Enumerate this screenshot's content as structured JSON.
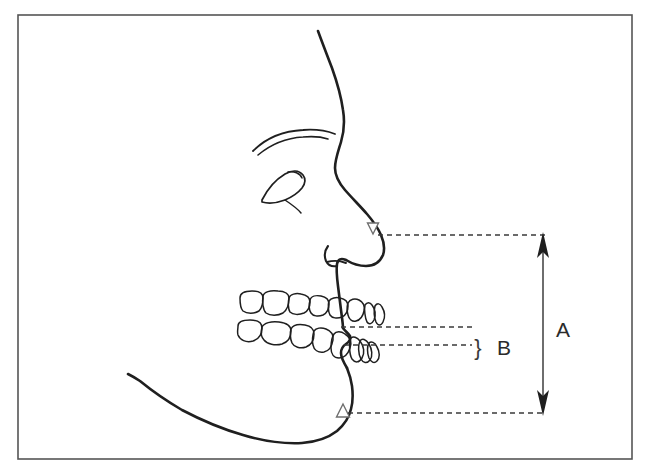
{
  "figure": {
    "type": "line-drawing-diagram",
    "background_color": "#ffffff",
    "border": {
      "present": true,
      "color": "#555555",
      "x": 18,
      "y": 15,
      "width": 614,
      "height": 444,
      "stroke_width": 1.6
    },
    "ink_color": "#1f1f1f",
    "marker_color": "#6f6f6f",
    "dash_color": "#3a3a3a"
  },
  "labels": [
    {
      "id": "measure-a",
      "text": "A",
      "x": 556,
      "y": 330,
      "meaning": "total vertical distance between upper reference marker and lower reference marker"
    },
    {
      "id": "measure-b",
      "text": "B",
      "x": 497,
      "y": 348,
      "meaning": "vertical distance between the two occlusal reference lines"
    },
    {
      "id": "brace-b",
      "text": "}",
      "x": 478,
      "y": 348,
      "meaning": "brace grouping the two occlusal dashed lines"
    }
  ],
  "markers": [
    {
      "id": "upper-marker",
      "glyph": "down-triangle",
      "x": 373,
      "y": 228,
      "size": 11,
      "filled": false,
      "description": "hollow downward-pointing triangle at the subnasale level on the nose underside"
    },
    {
      "id": "lower-marker",
      "glyph": "up-triangle",
      "x": 343,
      "y": 413,
      "size": 11,
      "filled": false,
      "description": "hollow upward-pointing triangle at the menton / chin level"
    }
  ],
  "dashed_lines": [
    {
      "id": "top-reference-line",
      "x1": 378,
      "y1": 235,
      "x2": 546,
      "y2": 235
    },
    {
      "id": "upper-occlusal-line",
      "x1": 341,
      "y1": 327,
      "x2": 472,
      "y2": 327
    },
    {
      "id": "lower-occlusal-line",
      "x1": 344,
      "y1": 345,
      "x2": 472,
      "y2": 345
    },
    {
      "id": "bottom-reference-line",
      "x1": 348,
      "y1": 413,
      "x2": 546,
      "y2": 413
    }
  ],
  "arrows": [
    {
      "id": "a-double-arrow",
      "orientation": "vertical",
      "double_headed": true,
      "x": 543,
      "y_top": 237,
      "y_bottom": 411,
      "connects": [
        "top-reference-line",
        "bottom-reference-line"
      ],
      "label": "A"
    }
  ],
  "anatomy": {
    "profile_outline": "forehead, glabella, nasal bridge, nose tip, columella, upper lip, lips, lower lip, mental sulcus, chin, jawline",
    "features": [
      "eyebrow",
      "eye",
      "nostril",
      "nasolabial hint",
      "upper dental arch",
      "lower dental arch"
    ],
    "teeth": {
      "upper_count": 8,
      "lower_count": 8
    }
  }
}
